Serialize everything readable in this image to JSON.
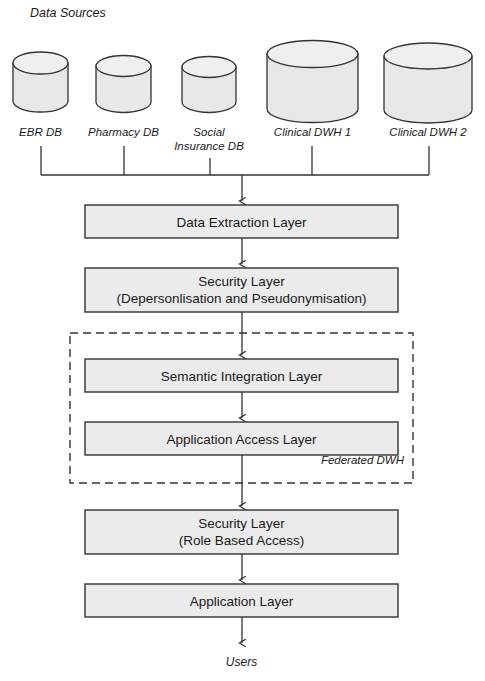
{
  "figure": {
    "top_caption_partial": "",
    "section_label": "Data Sources",
    "bottom_label": "Users",
    "federated_label": "Federated DWH"
  },
  "colors": {
    "stroke": "#333333",
    "box_fill": "#ebebeb",
    "cylinder_fill": "#e8e8e8",
    "dashed_stroke": "#333333",
    "background": "#ffffff",
    "text": "#1a1a1a"
  },
  "data_sources": [
    {
      "id": "ebr-db",
      "label": "EBR DB",
      "label_line2": "",
      "size": "small"
    },
    {
      "id": "pharmacy-db",
      "label": "Pharmacy DB",
      "label_line2": "",
      "size": "small"
    },
    {
      "id": "social-insurance-db",
      "label": "Social",
      "label_line2": "Insurance DB",
      "size": "small"
    },
    {
      "id": "clinical-dwh-1",
      "label": "Clinical DWH 1",
      "label_line2": "",
      "size": "large"
    },
    {
      "id": "clinical-dwh-2",
      "label": "Clinical DWH 2",
      "label_line2": "",
      "size": "large"
    }
  ],
  "layers": [
    {
      "id": "data-extraction-layer",
      "line1": "Data Extraction Layer",
      "line2": "",
      "in_federated_box": false
    },
    {
      "id": "security-layer-depersonalisation",
      "line1": "Security Layer",
      "line2": "(Depersonlisation and Pseudonymisation)",
      "in_federated_box": false
    },
    {
      "id": "semantic-integration-layer",
      "line1": "Semantic Integration Layer",
      "line2": "",
      "in_federated_box": true
    },
    {
      "id": "application-access-layer",
      "line1": "Application Access Layer",
      "line2": "",
      "in_federated_box": true
    },
    {
      "id": "security-layer-role-based-access",
      "line1": "Security Layer",
      "line2": "(Role Based Access)",
      "in_federated_box": false
    },
    {
      "id": "application-layer",
      "line1": "Application Layer",
      "line2": "",
      "in_federated_box": false
    }
  ]
}
